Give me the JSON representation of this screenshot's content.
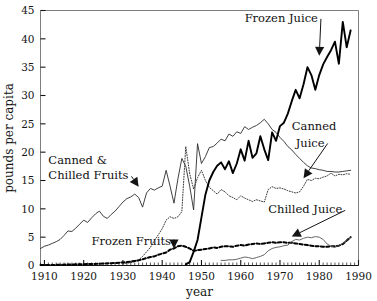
{
  "chart_data": {
    "type": "line",
    "title": "",
    "xlabel": "year",
    "ylabel": "pounds per capita",
    "xlim": [
      1909,
      1990
    ],
    "ylim": [
      0,
      45
    ],
    "yticks": [
      0,
      5,
      10,
      15,
      20,
      25,
      30,
      35,
      40,
      45
    ],
    "xticks": [
      1910,
      1920,
      1930,
      1940,
      1950,
      1960,
      1970,
      1980,
      1990
    ],
    "xtick_labels": [
      "1910",
      "1920",
      "1930",
      "1940",
      "1950",
      "1960",
      "1970",
      "1980",
      "1990"
    ],
    "ytick_labels": [
      "0",
      "5",
      "10",
      "15",
      "20",
      "25",
      "30",
      "35",
      "40",
      "45"
    ],
    "minor_tick_interval": 1,
    "grid": false,
    "legend": "inline-annotations",
    "series": [
      {
        "name": "Canned & Chilled Fruits",
        "style": "solid-thin",
        "color": "#2b2b2b",
        "x": [
          1909,
          1910,
          1911,
          1912,
          1913,
          1914,
          1915,
          1916,
          1917,
          1918,
          1919,
          1920,
          1921,
          1922,
          1923,
          1924,
          1925,
          1926,
          1927,
          1928,
          1929,
          1930,
          1931,
          1932,
          1933,
          1934,
          1935,
          1936,
          1937,
          1938,
          1939,
          1940,
          1941,
          1942,
          1943,
          1944,
          1945,
          1946,
          1947,
          1948,
          1949,
          1950,
          1951,
          1952,
          1953,
          1954,
          1955,
          1956,
          1957,
          1958,
          1959,
          1960,
          1961,
          1962,
          1963,
          1964,
          1965,
          1966,
          1967,
          1968,
          1969,
          1970,
          1971,
          1972,
          1973,
          1974,
          1975,
          1976,
          1977,
          1978,
          1979,
          1980,
          1981,
          1982,
          1983,
          1984,
          1985,
          1986,
          1987,
          1988
        ],
        "values": [
          3.0,
          3.4,
          3.6,
          3.9,
          4.2,
          4.6,
          5.3,
          6.1,
          6.0,
          6.6,
          7.3,
          8.0,
          7.6,
          8.4,
          9.1,
          9.6,
          8.7,
          8.3,
          9.0,
          9.6,
          10.4,
          11.2,
          11.8,
          12.1,
          12.6,
          12.0,
          10.3,
          12.8,
          13.6,
          13.3,
          13.7,
          14.0,
          16.8,
          14.0,
          11.0,
          15.3,
          18.9,
          17.5,
          14.0,
          9.8,
          21.5,
          18.0,
          19.2,
          20.8,
          21.0,
          21.6,
          22.3,
          22.0,
          23.2,
          22.8,
          23.6,
          23.3,
          24.5,
          24.0,
          24.4,
          24.7,
          25.2,
          25.8,
          25.0,
          24.0,
          23.5,
          22.6,
          21.9,
          21.0,
          20.4,
          19.6,
          18.9,
          18.2,
          17.6,
          17.2,
          17.1,
          16.9,
          16.8,
          16.6,
          16.6,
          16.5,
          16.5,
          16.6,
          16.7,
          16.8
        ]
      },
      {
        "name": "Canned Juice",
        "style": "dotted",
        "color": "#3a3a3a",
        "x": [
          1930,
          1931,
          1932,
          1933,
          1934,
          1935,
          1936,
          1937,
          1938,
          1939,
          1940,
          1941,
          1942,
          1943,
          1944,
          1945,
          1946,
          1947,
          1948,
          1949,
          1950,
          1951,
          1952,
          1953,
          1954,
          1955,
          1956,
          1957,
          1958,
          1959,
          1960,
          1961,
          1962,
          1963,
          1964,
          1965,
          1966,
          1967,
          1968,
          1969,
          1970,
          1971,
          1972,
          1973,
          1974,
          1975,
          1976,
          1977,
          1978,
          1979,
          1980,
          1981,
          1982,
          1983,
          1984,
          1985,
          1986,
          1987,
          1988
        ],
        "values": [
          0.3,
          0.4,
          0.5,
          0.7,
          1.0,
          1.6,
          2.4,
          3.2,
          4.4,
          5.4,
          6.5,
          8.0,
          8.6,
          8.3,
          8.6,
          9.5,
          21.0,
          16.2,
          13.5,
          15.5,
          16.8,
          15.0,
          13.8,
          13.2,
          12.6,
          13.4,
          13.0,
          12.3,
          12.0,
          11.6,
          12.3,
          11.9,
          11.6,
          11.3,
          11.6,
          11.4,
          11.2,
          13.4,
          13.9,
          13.6,
          13.7,
          13.5,
          13.2,
          13.0,
          12.8,
          13.0,
          14.0,
          15.2,
          15.0,
          15.4,
          15.3,
          15.6,
          15.8,
          16.3,
          15.8,
          16.1,
          16.0,
          16.2,
          16.1
        ]
      },
      {
        "name": "Frozen Juice",
        "style": "solid-thick",
        "color": "#000000",
        "x": [
          1946,
          1947,
          1948,
          1949,
          1950,
          1951,
          1952,
          1953,
          1954,
          1955,
          1956,
          1957,
          1958,
          1959,
          1960,
          1961,
          1962,
          1963,
          1964,
          1965,
          1966,
          1967,
          1968,
          1969,
          1970,
          1971,
          1972,
          1973,
          1974,
          1975,
          1976,
          1977,
          1978,
          1979,
          1980,
          1981,
          1982,
          1983,
          1984,
          1985,
          1986,
          1987,
          1988
        ],
        "values": [
          0.2,
          0.6,
          2.4,
          4.5,
          8.5,
          12.5,
          15.0,
          16.5,
          17.6,
          18.2,
          17.0,
          18.4,
          16.3,
          18.0,
          20.5,
          18.5,
          22.0,
          19.0,
          19.8,
          22.8,
          20.5,
          18.6,
          23.5,
          22.0,
          24.6,
          25.2,
          26.8,
          29.0,
          31.0,
          29.5,
          32.0,
          35.0,
          33.6,
          31.0,
          33.6,
          35.5,
          36.8,
          38.0,
          39.5,
          35.6,
          43.0,
          38.5,
          41.5
        ]
      },
      {
        "name": "Frozen Fruits",
        "style": "dashed-thick",
        "color": "#000000",
        "x": [
          1909,
          1912,
          1915,
          1918,
          1921,
          1924,
          1927,
          1929,
          1930,
          1931,
          1932,
          1933,
          1934,
          1935,
          1936,
          1937,
          1938,
          1939,
          1940,
          1941,
          1942,
          1943,
          1944,
          1945,
          1946,
          1947,
          1948,
          1949,
          1950,
          1951,
          1952,
          1953,
          1954,
          1955,
          1956,
          1957,
          1958,
          1959,
          1960,
          1961,
          1962,
          1963,
          1964,
          1965,
          1966,
          1967,
          1968,
          1969,
          1970,
          1971,
          1972,
          1973,
          1974,
          1975,
          1976,
          1977,
          1978,
          1979,
          1980,
          1981,
          1982,
          1983,
          1984,
          1985,
          1986,
          1987,
          1988
        ],
        "values": [
          0.1,
          0.1,
          0.15,
          0.2,
          0.25,
          0.3,
          0.4,
          0.5,
          0.55,
          0.6,
          0.7,
          0.8,
          0.9,
          1.1,
          1.3,
          1.5,
          1.6,
          1.9,
          2.1,
          2.3,
          2.8,
          3.0,
          3.4,
          3.5,
          3.3,
          3.0,
          2.6,
          2.7,
          2.8,
          2.9,
          3.0,
          3.2,
          3.1,
          3.3,
          3.4,
          3.4,
          3.3,
          3.5,
          3.6,
          3.5,
          3.7,
          3.8,
          3.9,
          3.8,
          3.9,
          4.0,
          4.1,
          4.0,
          4.1,
          4.1,
          4.0,
          4.0,
          3.9,
          3.8,
          3.7,
          3.6,
          3.5,
          3.4,
          3.4,
          3.3,
          3.3,
          3.4,
          3.4,
          3.5,
          3.8,
          4.4,
          5.0
        ]
      },
      {
        "name": "Chilled Juice",
        "style": "solid-thin",
        "color": "#555555",
        "x": [
          1955,
          1956,
          1957,
          1958,
          1959,
          1960,
          1961,
          1962,
          1963,
          1964,
          1965,
          1966,
          1967,
          1968,
          1969,
          1970,
          1971,
          1972,
          1973,
          1974,
          1975,
          1976,
          1977,
          1978,
          1979,
          1980,
          1981,
          1982,
          1983,
          1984,
          1985,
          1986,
          1987,
          1988
        ],
        "values": [
          0.9,
          0.9,
          1.0,
          1.0,
          1.1,
          1.3,
          1.5,
          1.4,
          1.2,
          1.4,
          1.6,
          1.9,
          2.6,
          3.0,
          3.2,
          3.3,
          3.5,
          3.6,
          4.2,
          4.6,
          4.5,
          4.8,
          5.0,
          4.9,
          5.1,
          5.0,
          4.6,
          3.8,
          3.4,
          3.2,
          3.5,
          3.9,
          4.4,
          5.0
        ]
      }
    ],
    "annotations": [
      {
        "text": "Canned &",
        "x": 1911,
        "y": 18.0,
        "arrow": false
      },
      {
        "text": "Chilled Fruits",
        "x": 1911,
        "y": 15.2,
        "arrow": true,
        "arrow_to": {
          "x": 1934,
          "y": 13.9
        }
      },
      {
        "text": "Frozen Fruits",
        "x": 1922,
        "y": 3.6,
        "arrow": true,
        "arrow_to": {
          "x": 1943,
          "y": 3.0
        }
      },
      {
        "text": "Frozen Juice",
        "x": 1961,
        "y": 43.0,
        "arrow": true,
        "arrow_to": {
          "x": 1980,
          "y": 37.0
        }
      },
      {
        "text": "Canned",
        "x": 1973,
        "y": 24.0,
        "arrow": false
      },
      {
        "text": "Juice",
        "x": 1974,
        "y": 21.0,
        "arrow": true,
        "arrow_to": {
          "x": 1976,
          "y": 15.4
        }
      },
      {
        "text": "Chilled Juice",
        "x": 1967,
        "y": 9.2,
        "arrow": true,
        "arrow_to": {
          "x": 1973,
          "y": 5.1
        }
      }
    ]
  }
}
